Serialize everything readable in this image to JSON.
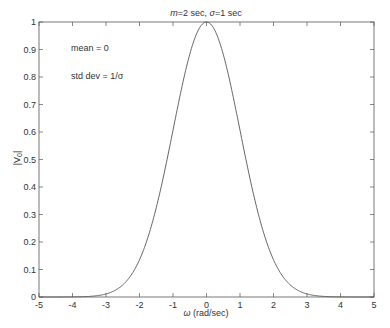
{
  "chart_data": {
    "type": "line",
    "title": "m=2 sec, σ=1 sec",
    "title_parts": {
      "m": "m",
      "m_rest": "=2 sec, ",
      "sigma": "σ",
      "sigma_rest": "=1 sec"
    },
    "xlabel": "ω (rad/sec)",
    "xlabel_parts": {
      "omega": "ω",
      "rest": " (rad/sec)"
    },
    "ylabel": "|V0|",
    "ylabel_parts": {
      "main": "|V",
      "sub": "0",
      "end": "|"
    },
    "xlim": [
      -5,
      5
    ],
    "ylim": [
      0,
      1
    ],
    "xticks": [
      "-5",
      "-4",
      "-3",
      "-2",
      "-1",
      "0",
      "1",
      "2",
      "3",
      "4",
      "5"
    ],
    "yticks": [
      "0",
      "0.1",
      "0.2",
      "0.3",
      "0.4",
      "0.5",
      "0.6",
      "0.7",
      "0.8",
      "0.9",
      "1"
    ],
    "grid": false,
    "annotations": [
      "mean = 0",
      "std dev = 1/σ"
    ],
    "series": [
      {
        "name": "|V0| = exp(-ω²/2)",
        "color": "#555555",
        "x": [
          -5,
          -4.75,
          -4.5,
          -4.25,
          -4,
          -3.75,
          -3.5,
          -3.25,
          -3,
          -2.75,
          -2.5,
          -2.25,
          -2,
          -1.75,
          -1.5,
          -1.25,
          -1,
          -0.75,
          -0.5,
          -0.25,
          0,
          0.25,
          0.5,
          0.75,
          1,
          1.25,
          1.5,
          1.75,
          2,
          2.25,
          2.5,
          2.75,
          3,
          3.25,
          3.5,
          3.75,
          4,
          4.25,
          4.5,
          4.75,
          5
        ],
        "y": [
          0.0,
          0.0,
          0.0,
          0.0001,
          0.0003,
          0.0009,
          0.0022,
          0.0051,
          0.0111,
          0.0228,
          0.0439,
          0.0796,
          0.1353,
          0.2163,
          0.3247,
          0.4578,
          0.6065,
          0.7548,
          0.8825,
          0.9692,
          1.0,
          0.9692,
          0.8825,
          0.7548,
          0.6065,
          0.4578,
          0.3247,
          0.2163,
          0.1353,
          0.0796,
          0.0439,
          0.0228,
          0.0111,
          0.0051,
          0.0022,
          0.0009,
          0.0003,
          0.0001,
          0.0,
          0.0,
          0.0
        ]
      }
    ]
  },
  "style": {
    "axis_color": "#555555",
    "text_color": "#333333",
    "line_color": "#555555",
    "background": "#ffffff"
  }
}
